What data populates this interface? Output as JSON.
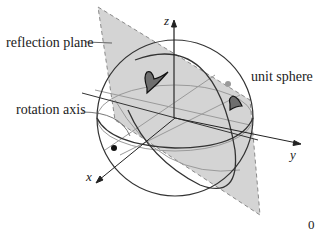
{
  "figure": {
    "labels": {
      "reflection_plane": "reflection plane",
      "unit_sphere": "unit sphere",
      "rotation_axis": "rotation axis",
      "axis_x": "x",
      "axis_y": "y",
      "axis_z": "z",
      "corner_number": "0"
    },
    "colors": {
      "plane_fill": "#d4d4d4",
      "plane_edge": "#8a8a8a",
      "sphere_line": "#333333",
      "inner_line": "#9a9a9a",
      "shape_fill": "#6e6e6e",
      "dot_black": "#111111",
      "dot_gray": "#9a9a9a"
    },
    "elements": [
      "reflection-plane",
      "unit-sphere",
      "equator-great-circle",
      "tilted-great-circle",
      "rotation-axis",
      "x-axis",
      "y-axis",
      "z-axis",
      "shape-upper",
      "shape-reflected",
      "black-point",
      "gray-point"
    ]
  }
}
